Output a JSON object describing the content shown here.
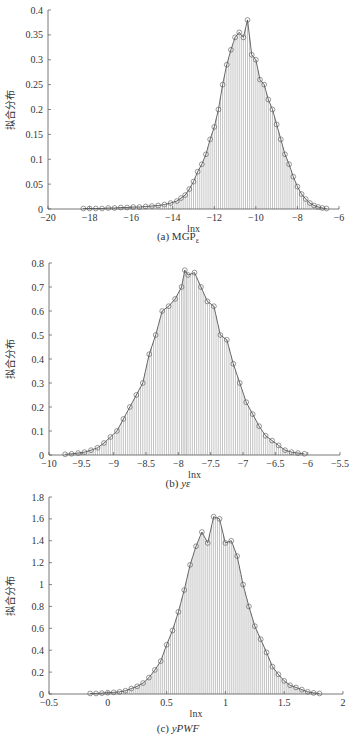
{
  "chart_data": [
    {
      "type": "bar",
      "subtype": "histogram-with-fitted-line-and-markers",
      "caption": "(a) MGPε",
      "caption_main": "(a) MGP",
      "caption_sub": "ε",
      "xlabel": "lnx",
      "ylabel": "拟合分布",
      "xlim": [
        -20,
        -6
      ],
      "ylim": [
        0,
        0.4
      ],
      "xticks": [
        -20,
        -18,
        -16,
        -14,
        -12,
        -10,
        -8,
        -6
      ],
      "yticks": [
        0,
        0.05,
        0.1,
        0.15,
        0.2,
        0.25,
        0.3,
        0.35,
        0.4
      ],
      "ytick_labels": [
        "0",
        "0.05",
        "0.1",
        "0.15",
        "0.2",
        "0.25",
        "0.3",
        "0.35",
        "0.4"
      ],
      "grid": false,
      "x": [
        -18.3,
        -18.0,
        -17.7,
        -17.4,
        -17.1,
        -16.8,
        -16.5,
        -16.2,
        -15.9,
        -15.6,
        -15.3,
        -15.0,
        -14.7,
        -14.4,
        -14.1,
        -13.8,
        -13.6,
        -13.4,
        -13.2,
        -13.0,
        -12.8,
        -12.6,
        -12.4,
        -12.2,
        -12.0,
        -11.8,
        -11.6,
        -11.4,
        -11.2,
        -11.0,
        -10.8,
        -10.6,
        -10.4,
        -10.2,
        -10.0,
        -9.8,
        -9.6,
        -9.4,
        -9.2,
        -9.0,
        -8.8,
        -8.6,
        -8.4,
        -8.2,
        -8.0,
        -7.8,
        -7.6,
        -7.4,
        -7.2,
        -7.0,
        -6.8,
        -6.6
      ],
      "values": [
        0.001,
        0.001,
        0.001,
        0.001,
        0.002,
        0.002,
        0.003,
        0.003,
        0.004,
        0.004,
        0.005,
        0.006,
        0.007,
        0.009,
        0.012,
        0.016,
        0.022,
        0.028,
        0.04,
        0.055,
        0.075,
        0.09,
        0.11,
        0.14,
        0.165,
        0.2,
        0.25,
        0.29,
        0.32,
        0.345,
        0.355,
        0.345,
        0.38,
        0.31,
        0.3,
        0.26,
        0.25,
        0.22,
        0.2,
        0.17,
        0.14,
        0.11,
        0.09,
        0.065,
        0.045,
        0.03,
        0.02,
        0.012,
        0.007,
        0.004,
        0.002,
        0.001
      ]
    },
    {
      "type": "bar",
      "subtype": "histogram-with-fitted-line-and-markers",
      "caption": "(b) yε",
      "caption_main": "(b) ",
      "caption_sub": "yε",
      "xlabel": "lnx",
      "ylabel": "拟合分布",
      "xlim": [
        -10,
        -5.5
      ],
      "ylim": [
        0,
        0.8
      ],
      "xticks": [
        -10,
        -9.5,
        -9,
        -8.5,
        -8,
        -7.5,
        -7,
        -6.5,
        -6,
        -5.5
      ],
      "yticks": [
        0,
        0.1,
        0.2,
        0.3,
        0.4,
        0.5,
        0.6,
        0.7,
        0.8
      ],
      "ytick_labels": [
        "0",
        "0.1",
        "0.2",
        "0.3",
        "0.4",
        "0.5",
        "0.6",
        "0.7",
        "0.8"
      ],
      "grid": false,
      "x": [
        -9.75,
        -9.65,
        -9.55,
        -9.45,
        -9.35,
        -9.25,
        -9.15,
        -9.05,
        -8.95,
        -8.85,
        -8.75,
        -8.65,
        -8.55,
        -8.45,
        -8.35,
        -8.25,
        -8.15,
        -8.05,
        -7.95,
        -7.9,
        -7.85,
        -7.75,
        -7.65,
        -7.55,
        -7.45,
        -7.35,
        -7.25,
        -7.15,
        -7.05,
        -6.95,
        -6.85,
        -6.75,
        -6.65,
        -6.55,
        -6.45,
        -6.35,
        -6.25,
        -6.15,
        -6.05
      ],
      "values": [
        0.003,
        0.005,
        0.008,
        0.012,
        0.02,
        0.03,
        0.05,
        0.075,
        0.1,
        0.15,
        0.2,
        0.25,
        0.3,
        0.42,
        0.5,
        0.6,
        0.62,
        0.65,
        0.7,
        0.77,
        0.75,
        0.76,
        0.7,
        0.64,
        0.62,
        0.5,
        0.48,
        0.38,
        0.3,
        0.22,
        0.17,
        0.12,
        0.08,
        0.06,
        0.04,
        0.02,
        0.012,
        0.008,
        0.005
      ]
    },
    {
      "type": "bar",
      "subtype": "histogram-with-fitted-line-and-markers",
      "caption": "(c) yPWF",
      "caption_main": "(c) ",
      "caption_sub": "yPWF",
      "xlabel": "lnx",
      "ylabel": "拟合分布",
      "xlim": [
        -0.5,
        2
      ],
      "ylim": [
        0,
        1.8
      ],
      "xticks": [
        -0.5,
        0,
        0.5,
        1,
        1.5,
        2
      ],
      "yticks": [
        0,
        0.2,
        0.4,
        0.6,
        0.8,
        1,
        1.2,
        1.4,
        1.6,
        1.8
      ],
      "ytick_labels": [
        "0",
        "0.2",
        "0.4",
        "0.6",
        "0.8",
        "1",
        "1.2",
        "1.4",
        "1.6",
        "1.8"
      ],
      "grid": false,
      "x": [
        -0.15,
        -0.1,
        -0.05,
        0.0,
        0.05,
        0.1,
        0.15,
        0.2,
        0.25,
        0.3,
        0.35,
        0.4,
        0.45,
        0.5,
        0.55,
        0.6,
        0.65,
        0.7,
        0.75,
        0.8,
        0.85,
        0.9,
        0.95,
        1.0,
        1.05,
        1.1,
        1.15,
        1.2,
        1.25,
        1.3,
        1.35,
        1.4,
        1.45,
        1.5,
        1.55,
        1.6,
        1.65,
        1.7,
        1.75,
        1.8
      ],
      "values": [
        0.005,
        0.005,
        0.008,
        0.012,
        0.015,
        0.02,
        0.03,
        0.05,
        0.07,
        0.1,
        0.15,
        0.22,
        0.3,
        0.45,
        0.58,
        0.75,
        0.95,
        1.18,
        1.35,
        1.48,
        1.38,
        1.62,
        1.6,
        1.38,
        1.4,
        1.26,
        1.0,
        0.8,
        0.62,
        0.5,
        0.38,
        0.25,
        0.18,
        0.12,
        0.08,
        0.06,
        0.04,
        0.02,
        0.01,
        0.005
      ]
    }
  ],
  "panels": [
    {
      "caption_prefix": "(a) MGP",
      "caption_sub": "ε"
    },
    {
      "caption_prefix": "(b) ",
      "caption_sub": "yε"
    },
    {
      "caption_prefix": "(c) ",
      "caption_sub": "yPWF"
    }
  ],
  "colors": {
    "axis": "#555555",
    "bar": "#9a9a9a",
    "line": "#444444",
    "marker": "#555555",
    "text": "#333333"
  }
}
